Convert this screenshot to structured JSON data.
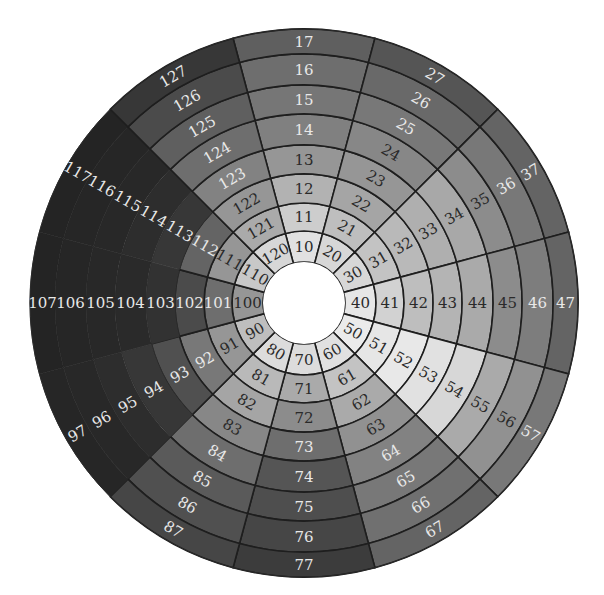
{
  "diagram": {
    "type": "polar-sector-heatmap",
    "center": [
      304,
      303
    ],
    "inner_radius": 41,
    "outer_radius": 274,
    "rings": 8,
    "sectors": 12,
    "sector_width_deg": 30,
    "border_color": "#1e1e1e",
    "light_text_color": "#e8e8e8",
    "dark_text_color": "#2a2a2a",
    "ring_radii": [
      41,
      72,
      100,
      129,
      158,
      189,
      218,
      249,
      274
    ],
    "sector_list": [
      {
        "id": 1,
        "center_angle_deg": 90,
        "labels": [
          "10",
          "11",
          "12",
          "13",
          "14",
          "15",
          "16",
          "17"
        ],
        "gray": [
          225,
          205,
          178,
          150,
          128,
          118,
          110,
          95
        ],
        "hide_inner_borders_from": null
      },
      {
        "id": 2,
        "center_angle_deg": 60,
        "labels": [
          "20",
          "21",
          "22",
          "23",
          "24",
          "25",
          "26",
          "27"
        ],
        "gray": [
          215,
          190,
          165,
          150,
          135,
          120,
          105,
          85
        ],
        "hide_inner_borders_from": null
      },
      {
        "id": 3,
        "center_angle_deg": 30,
        "labels": [
          "30",
          "31",
          "32",
          "33",
          "34",
          "35",
          "36",
          "37"
        ],
        "gray": [
          215,
          195,
          185,
          175,
          168,
          140,
          120,
          100
        ],
        "hide_inner_borders_from": null
      },
      {
        "id": 4,
        "center_angle_deg": 0,
        "labels": [
          "40",
          "41",
          "42",
          "43",
          "44",
          "45",
          "46",
          "47"
        ],
        "gray": [
          230,
          210,
          190,
          180,
          170,
          140,
          125,
          100
        ],
        "hide_inner_borders_from": null
      },
      {
        "id": 5,
        "center_angle_deg": -30,
        "labels": [
          "50",
          "51",
          "52",
          "53",
          "54",
          "55",
          "56",
          "57"
        ],
        "gray": [
          235,
          230,
          232,
          225,
          215,
          170,
          145,
          120
        ],
        "hide_inner_borders_from": null
      },
      {
        "id": 6,
        "center_angle_deg": -60,
        "labels": [
          "60",
          "61",
          "62",
          "63",
          "64",
          "65",
          "66",
          "67"
        ],
        "gray": [
          225,
          195,
          170,
          145,
          130,
          120,
          112,
          100
        ],
        "hide_inner_borders_from": null
      },
      {
        "id": 7,
        "center_angle_deg": -90,
        "labels": [
          "70",
          "71",
          "72",
          "73",
          "74",
          "75",
          "76",
          "77"
        ],
        "gray": [
          220,
          170,
          140,
          110,
          85,
          78,
          70,
          60
        ],
        "hide_inner_borders_from": null
      },
      {
        "id": 8,
        "center_angle_deg": -120,
        "labels": [
          "80",
          "81",
          "82",
          "83",
          "84",
          "85",
          "86",
          "87"
        ],
        "gray": [
          220,
          185,
          165,
          135,
          110,
          90,
          80,
          70
        ],
        "hide_inner_borders_from": null
      },
      {
        "id": 9,
        "center_angle_deg": -150,
        "labels": [
          "90",
          "91",
          "92",
          "93",
          "94",
          "95",
          "96",
          "97"
        ],
        "gray": [
          190,
          150,
          120,
          80,
          55,
          45,
          40,
          38
        ],
        "hide_inner_borders_from": 4
      },
      {
        "id": 10,
        "center_angle_deg": 180,
        "labels": [
          "100",
          "101",
          "102",
          "103",
          "104",
          "105",
          "106",
          "107"
        ],
        "gray": [
          150,
          110,
          75,
          50,
          42,
          40,
          38,
          36
        ],
        "hide_inner_borders_from": 3
      },
      {
        "id": 11,
        "center_angle_deg": 150,
        "labels": [
          "110",
          "111",
          "112",
          "113",
          "114",
          "115",
          "116",
          "117"
        ],
        "gray": [
          200,
          150,
          100,
          55,
          45,
          40,
          38,
          36
        ],
        "hide_inner_borders_from": 3
      },
      {
        "id": 12,
        "center_angle_deg": 120,
        "labels": [
          "120",
          "121",
          "122",
          "123",
          "124",
          "125",
          "126",
          "127"
        ],
        "gray": [
          215,
          170,
          150,
          130,
          110,
          95,
          75,
          55
        ],
        "hide_inner_borders_from": null
      }
    ]
  }
}
